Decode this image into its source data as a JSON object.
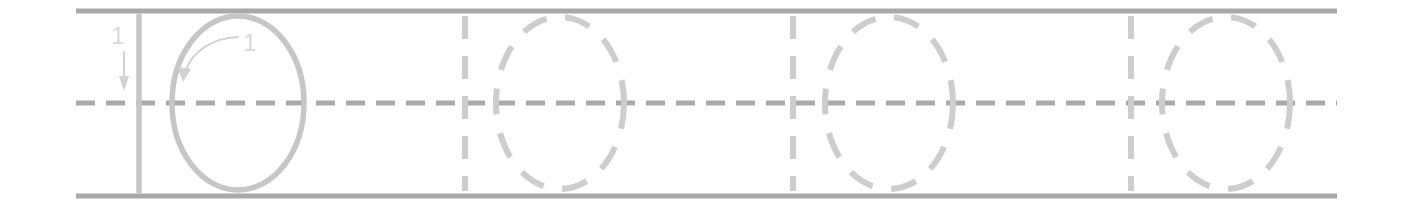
{
  "worksheet": {
    "title": "Number tracing practice row: 1 and 0",
    "row_label": "",
    "colors": {
      "rule_line": "#a9a9a9",
      "midline": "#a9a9a9",
      "model_glyph": "#c6c6c6",
      "trace_glyph": "#cdcdcd",
      "guide_arrow": "#d2d2d2",
      "guide_number": "#d8d8d8",
      "background": "#ffffff"
    },
    "guides": {
      "top_rule_y": 11,
      "midline_y": 103,
      "bottom_rule_y": 196,
      "content_left_x": 76,
      "content_right_x": 1337
    },
    "stroke_order_labels": {
      "one": "1",
      "zero": "1"
    },
    "groups": [
      {
        "index": 1,
        "kind": "model",
        "characters": [
          {
            "glyph": "1",
            "style": "solid",
            "stroke_count": 1,
            "stroke_number": "1",
            "has_direction_arrow": true,
            "arrow_direction": "down",
            "x": 139
          },
          {
            "glyph": "0",
            "style": "solid",
            "stroke_count": 1,
            "stroke_number": "1",
            "has_direction_arrow": true,
            "arrow_direction": "counterclockwise",
            "cx": 238,
            "cy": 103,
            "rx": 66,
            "ry": 87
          }
        ]
      },
      {
        "index": 2,
        "kind": "trace",
        "characters": [
          {
            "glyph": "1",
            "style": "dashed",
            "x": 465
          },
          {
            "glyph": "0",
            "style": "dashed",
            "cx": 560,
            "cy": 103,
            "rx": 64,
            "ry": 86
          }
        ]
      },
      {
        "index": 3,
        "kind": "trace",
        "characters": [
          {
            "glyph": "1",
            "style": "dashed",
            "x": 793
          },
          {
            "glyph": "0",
            "style": "dashed",
            "cx": 889,
            "cy": 103,
            "rx": 64,
            "ry": 86
          }
        ]
      },
      {
        "index": 4,
        "kind": "trace",
        "characters": [
          {
            "glyph": "1",
            "style": "dashed",
            "x": 1131
          },
          {
            "glyph": "0",
            "style": "dashed",
            "cx": 1226,
            "cy": 103,
            "rx": 64,
            "ry": 86
          }
        ]
      }
    ]
  }
}
